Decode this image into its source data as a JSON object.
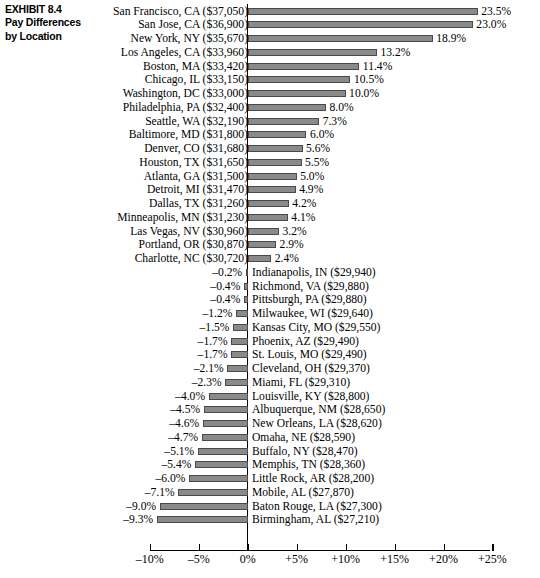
{
  "exhibit": {
    "label": "EXHIBIT 8.4",
    "title_line1": "Pay Differences",
    "title_line2": "by Location"
  },
  "chart_data": {
    "type": "bar",
    "orientation": "horizontal",
    "title": "Pay Differences by Location",
    "xlabel": "",
    "ylabel": "",
    "xlim": [
      -10,
      25
    ],
    "grid": false,
    "legend": "none",
    "value_suffix": "%",
    "xticks": [
      -10,
      -5,
      0,
      5,
      10,
      15,
      20,
      25
    ],
    "xticklabels": [
      "–10%",
      "–5%",
      "0%",
      "+5%",
      "+10%",
      "+15%",
      "+20%",
      "+25%"
    ],
    "bar_color": "#8a8a8a",
    "bar_edge_color": "#4a4a4a",
    "axis_color": "#000000",
    "categories": [
      "San Francisco, CA ($37,050)",
      "San Jose, CA ($36,900)",
      "New York, NY ($35,670)",
      "Los Angeles, CA ($33,960)",
      "Boston, MA ($33,420)",
      "Chicago, IL ($33,150)",
      "Washington, DC ($33,000)",
      "Philadelphia, PA ($32,400)",
      "Seattle, WA ($32,190)",
      "Baltimore, MD ($31,800)",
      "Denver, CO ($31,680)",
      "Houston, TX ($31,650)",
      "Atlanta, GA ($31,500)",
      "Detroit, MI ($31,470)",
      "Dallas, TX ($31,260)",
      "Minneapolis, MN ($31,230)",
      "Las Vegas, NV ($30,960)",
      "Portland, OR ($30,870)",
      "Charlotte, NC ($30,720)",
      "Indianapolis, IN ($29,940)",
      "Richmond, VA ($29,880)",
      "Pittsburgh, PA ($29,880)",
      "Milwaukee, WI ($29,640)",
      "Kansas City, MO ($29,550)",
      "Phoenix, AZ ($29,490)",
      "St. Louis, MO ($29,490)",
      "Cleveland, OH ($29,370)",
      "Miami, FL ($29,310)",
      "Louisville, KY ($28,800)",
      "Albuquerque, NM ($28,650)",
      "New Orleans, LA ($28,620)",
      "Omaha, NE ($28,590)",
      "Buffalo, NY ($28,470)",
      "Memphis, TN ($28,360)",
      "Little Rock, AR ($28,200)",
      "Mobile, AL ($27,870)",
      "Baton Rouge, LA ($27,300)",
      "Birmingham, AL ($27,210)"
    ],
    "values": [
      23.5,
      23.0,
      18.9,
      13.2,
      11.4,
      10.5,
      10.0,
      8.0,
      7.3,
      6.0,
      5.6,
      5.5,
      5.0,
      4.9,
      4.2,
      4.1,
      3.2,
      2.9,
      2.4,
      -0.2,
      -0.4,
      -0.4,
      -1.2,
      -1.5,
      -1.7,
      -1.7,
      -2.1,
      -2.3,
      -4.0,
      -4.5,
      -4.6,
      -4.7,
      -5.1,
      -5.4,
      -6.0,
      -7.1,
      -9.0,
      -9.3
    ],
    "value_labels": [
      "23.5%",
      "23.0%",
      "18.9%",
      "13.2%",
      "11.4%",
      "10.5%",
      "10.0%",
      "8.0%",
      "7.3%",
      "6.0%",
      "5.6%",
      "5.5%",
      "5.0%",
      "4.9%",
      "4.2%",
      "4.1%",
      "3.2%",
      "2.9%",
      "2.4%",
      "–0.2%",
      "–0.4%",
      "–0.4%",
      "–1.2%",
      "–1.5%",
      "–1.7%",
      "–1.7%",
      "–2.1%",
      "–2.3%",
      "–4.0%",
      "–4.5%",
      "–4.6%",
      "–4.7%",
      "–5.1%",
      "–5.4%",
      "–6.0%",
      "–7.1%",
      "–9.0%",
      "–9.3%"
    ]
  }
}
